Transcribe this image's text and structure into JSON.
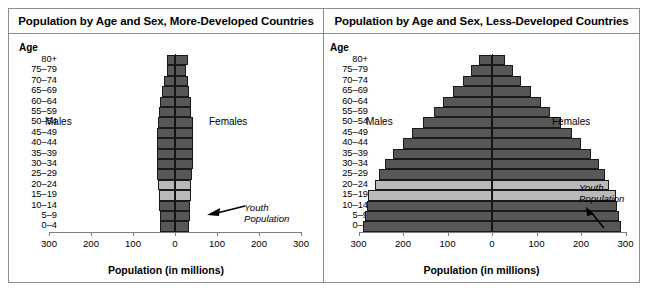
{
  "figure": {
    "axis_title": "Population (in millions)",
    "age_header": "Age",
    "males_label": "Males",
    "females_label": "Females",
    "annotation": {
      "line1": "Youth",
      "line2": "Population"
    },
    "colors": {
      "bar_fill": "#575757",
      "youth_fill": "#b9b9b9",
      "bar_stroke": "#1a1a1a",
      "panel_border": "#8d8d8d",
      "axis": "#7d7d7d",
      "background": "#ffffff"
    },
    "tick_labels": [
      "300",
      "200",
      "100",
      "0",
      "100",
      "200",
      "300"
    ],
    "age_groups": [
      "80+",
      "75–79",
      "70–74",
      "65–69",
      "60–64",
      "55–59",
      "50–54",
      "45–49",
      "40–44",
      "35–39",
      "30–34",
      "25–29",
      "20–24",
      "15–19",
      "10–14",
      "5–9",
      "0–4"
    ],
    "youth_groups": [
      "20–24",
      "15–19"
    ]
  },
  "chart_data": [
    {
      "type": "bar",
      "orientation": "population-pyramid",
      "title": "Population by Age and Sex, More-Developed Countries",
      "xlabel": "Population (in millions)",
      "ylabel": "Age",
      "xlim": [
        -300,
        300
      ],
      "xticks": [
        -300,
        -200,
        -100,
        0,
        100,
        200,
        300
      ],
      "xticklabels": [
        "300",
        "200",
        "100",
        "0",
        "100",
        "200",
        "300"
      ],
      "grid": false,
      "legend": "none",
      "categories": [
        "80+",
        "75–79",
        "70–74",
        "65–69",
        "60–64",
        "55–59",
        "50–54",
        "45–49",
        "40–44",
        "35–39",
        "30–34",
        "25–29",
        "20–24",
        "15–19",
        "10–14",
        "5–9",
        "0–4"
      ],
      "series": [
        {
          "name": "Males",
          "values": [
            20,
            20,
            27,
            32,
            36,
            38,
            41,
            44,
            44,
            43,
            42,
            42,
            40,
            39,
            37,
            36,
            36
          ]
        },
        {
          "name": "Females",
          "values": [
            32,
            25,
            30,
            34,
            37,
            39,
            42,
            44,
            44,
            43,
            42,
            41,
            39,
            37,
            36,
            35,
            34
          ]
        }
      ],
      "highlight": {
        "label": "Youth Population",
        "categories": [
          "20–24",
          "15–19"
        ],
        "color": "#b9b9b9"
      }
    },
    {
      "type": "bar",
      "orientation": "population-pyramid",
      "title": "Population by Age and Sex, Less-Developed Countries",
      "xlabel": "Population (in millions)",
      "ylabel": "Age",
      "xlim": [
        -300,
        300
      ],
      "xticks": [
        -300,
        -200,
        -100,
        0,
        100,
        200,
        300
      ],
      "xticklabels": [
        "300",
        "200",
        "100",
        "0",
        "100",
        "200",
        "300"
      ],
      "grid": false,
      "legend": "none",
      "categories": [
        "80+",
        "75–79",
        "70–74",
        "65–69",
        "60–64",
        "55–59",
        "50–54",
        "45–49",
        "40–44",
        "35–39",
        "30–34",
        "25–29",
        "20–24",
        "15–19",
        "10–14",
        "5–9",
        "0–4"
      ],
      "series": [
        {
          "name": "Males",
          "values": [
            30,
            48,
            65,
            88,
            110,
            130,
            155,
            180,
            200,
            222,
            240,
            255,
            262,
            278,
            282,
            285,
            290
          ]
        },
        {
          "name": "Females",
          "values": [
            30,
            48,
            65,
            88,
            110,
            130,
            155,
            180,
            200,
            222,
            240,
            255,
            262,
            278,
            282,
            285,
            290
          ]
        }
      ],
      "highlight": {
        "label": "Youth Population",
        "categories": [
          "20–24",
          "15–19"
        ],
        "color": "#b9b9b9"
      }
    }
  ]
}
